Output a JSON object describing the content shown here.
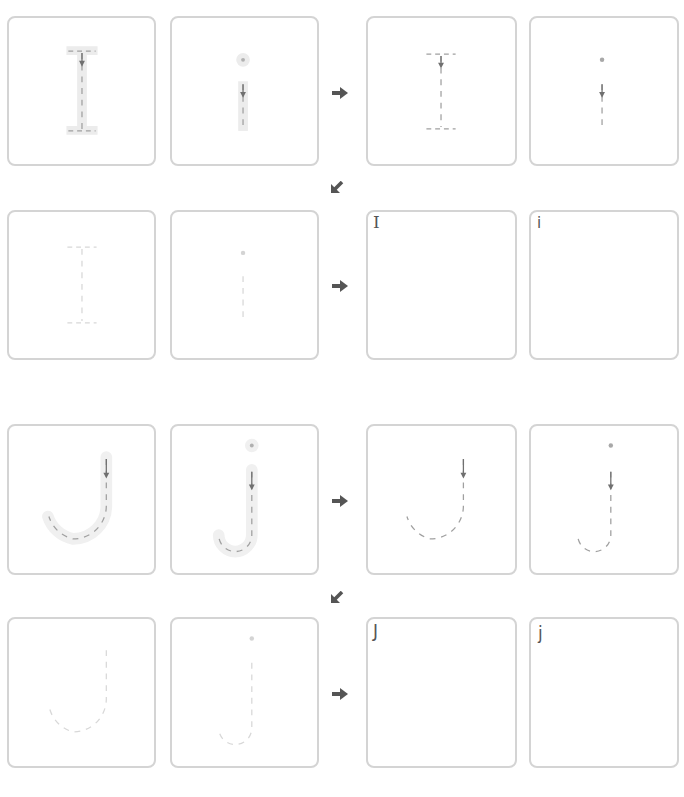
{
  "worksheet": {
    "sections": [
      {
        "letter_upper": "I",
        "letter_lower": "i",
        "rows": [
          {
            "stage": "guided-trace",
            "cells": [
              "I",
              "i"
            ]
          },
          {
            "stage": "dashed-trace",
            "cells": [
              "I",
              "i"
            ]
          },
          {
            "stage": "faint-trace",
            "cells": [
              "I",
              "i"
            ]
          },
          {
            "stage": "free-write",
            "cells": [
              "I",
              "i"
            ]
          }
        ]
      },
      {
        "letter_upper": "J",
        "letter_lower": "j",
        "rows": [
          {
            "stage": "guided-trace",
            "cells": [
              "J",
              "j"
            ]
          },
          {
            "stage": "dashed-trace",
            "cells": [
              "J",
              "j"
            ]
          },
          {
            "stage": "faint-trace",
            "cells": [
              "J",
              "j"
            ]
          },
          {
            "stage": "free-write",
            "cells": [
              "J",
              "j"
            ]
          }
        ]
      }
    ],
    "free_write_labels": {
      "I_upper": "I",
      "I_lower": "i",
      "J_upper": "J",
      "J_lower": "j"
    },
    "icons": {
      "next": "arrow-right-icon",
      "continue": "arrow-down-left-icon"
    },
    "colors": {
      "box_border": "#d4d4d4",
      "guide_fill": "#ececec",
      "dash_dark": "#9a9a9a",
      "dash_faint": "#d8d8d8",
      "arrow": "#555555"
    }
  }
}
